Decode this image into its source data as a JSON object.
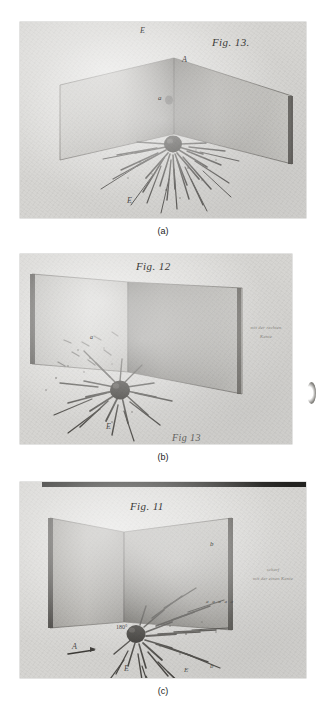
{
  "document": {
    "type": "scanned-figure-plate",
    "panel_count": 3,
    "background_color": "#ffffff",
    "plate_color": "#d9d9d7"
  },
  "panels": [
    {
      "caption": "(a)",
      "figure_label": "Fig. 13.",
      "annotations": [
        {
          "text": "E",
          "kind": "point-label"
        },
        {
          "text": "A",
          "kind": "point-label"
        },
        {
          "text": "a",
          "kind": "point-label"
        },
        {
          "text": "E",
          "kind": "point-label"
        }
      ],
      "handwritten_notes": [],
      "description": "Two grey planes meeting at a vertical corner with a dark sphere at the base and radiating iron-filing streaks on the floor"
    },
    {
      "caption": "(b)",
      "figure_label": "Fig. 12",
      "annotations": [
        {
          "text": "a",
          "kind": "point-label"
        },
        {
          "text": "E",
          "kind": "point-label"
        },
        {
          "text": "Fig 13",
          "kind": "cropped-figure-label"
        }
      ],
      "handwritten_notes": [
        {
          "line1": "mit der rechten",
          "line2": "Kante"
        }
      ],
      "description": "Two grey planes opened to a wide angle with a dark sphere at the lower left and dense filing pattern"
    },
    {
      "caption": "(c)",
      "figure_label": "Fig. 11",
      "annotations": [
        {
          "text": "A",
          "kind": "point-label"
        },
        {
          "text": "E",
          "kind": "point-label"
        },
        {
          "text": "E",
          "kind": "point-label"
        },
        {
          "text": "a",
          "kind": "point-label"
        },
        {
          "text": "b",
          "kind": "point-label"
        },
        {
          "text": "180°",
          "kind": "angle-label"
        },
        {
          "text": "a a a a a",
          "kind": "series-label"
        }
      ],
      "handwritten_notes": [
        {
          "line1": "scharf",
          "line2": "mit der einen Kante"
        }
      ],
      "description": "Two grey planes forming a corner with a dark sphere and arrow-like filing streaks fanning to the right"
    }
  ],
  "captions": {
    "a": "(a)",
    "b": "(b)",
    "c": "(c)"
  },
  "labels": {
    "fig13": "Fig. 13.",
    "fig12": "Fig. 12",
    "fig11": "Fig. 11",
    "fig13_cropped": "Fig 13",
    "E": "E",
    "A": "A",
    "a": "a",
    "b": "b",
    "angle180": "180°",
    "a_series": "a a a a a"
  },
  "handwriting": {
    "b_note_line1": "mit der rechten",
    "b_note_line2": "Kante",
    "c_note_line1": "scharf",
    "c_note_line2": "mit der einen Kante"
  },
  "colors": {
    "plate": "#d9d9d7",
    "wall_light": "#cfcfcc",
    "wall_dark": "#8f8d88",
    "ink": "#3a3a38",
    "sphere": "#2e2c28",
    "page": "#ffffff"
  }
}
